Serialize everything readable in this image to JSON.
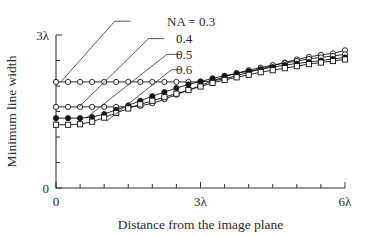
{
  "chart_data": {
    "type": "line",
    "title": "",
    "xlabel": "Distance from the image plane",
    "ylabel": "Minimum line width",
    "xlim": [
      0,
      6
    ],
    "ylim": [
      0,
      3
    ],
    "xtick_labels": [
      "0",
      "3λ",
      "6λ"
    ],
    "xtick_values": [
      0,
      3,
      6
    ],
    "ytick_labels": [
      "0",
      "3λ"
    ],
    "ytick_values": [
      0,
      3
    ],
    "x_minor_step": 0.5,
    "y_minor_step": 0.5,
    "grid": false,
    "legend_position": "upper-left-leader-lines",
    "legend_entries": [
      "NA = 0.3",
      "0.4",
      "0.5",
      "0.6"
    ],
    "series": [
      {
        "name": "NA = 0.3",
        "label": "NA = 0.3",
        "marker": "open-circle",
        "color": "#111111",
        "x": [
          0,
          0.25,
          0.5,
          0.75,
          1.0,
          1.25,
          1.5,
          1.75,
          2.0,
          2.25,
          2.5,
          2.75,
          3.0,
          3.25,
          3.5,
          3.75,
          4.0,
          4.25,
          4.5,
          4.75,
          5.0,
          5.25,
          5.5,
          5.75,
          6.0
        ],
        "y": [
          2.08,
          2.08,
          2.08,
          2.08,
          2.08,
          2.08,
          2.08,
          2.08,
          2.08,
          2.08,
          2.08,
          2.08,
          2.08,
          2.1,
          2.14,
          2.2,
          2.27,
          2.33,
          2.4,
          2.46,
          2.52,
          2.57,
          2.61,
          2.64,
          2.7
        ]
      },
      {
        "name": "NA = 0.4",
        "label": "0.4",
        "marker": "open-circle",
        "color": "#111111",
        "x": [
          0,
          0.25,
          0.5,
          0.75,
          1.0,
          1.25,
          1.5,
          1.75,
          2.0,
          2.25,
          2.5,
          2.75,
          3.0,
          3.25,
          3.5,
          3.75,
          4.0,
          4.25,
          4.5,
          4.75,
          5.0,
          5.25,
          5.5,
          5.75,
          6.0
        ],
        "y": [
          1.59,
          1.59,
          1.59,
          1.59,
          1.59,
          1.59,
          1.59,
          1.61,
          1.66,
          1.74,
          1.83,
          1.92,
          2.01,
          2.1,
          2.18,
          2.25,
          2.31,
          2.36,
          2.41,
          2.45,
          2.49,
          2.53,
          2.56,
          2.59,
          2.62
        ]
      },
      {
        "name": "NA = 0.5",
        "label": "0.5",
        "marker": "filled-circle",
        "color": "#111111",
        "x": [
          0,
          0.25,
          0.5,
          0.75,
          1.0,
          1.25,
          1.5,
          1.75,
          2.0,
          2.25,
          2.5,
          2.75,
          3.0,
          3.25,
          3.5,
          3.75,
          4.0,
          4.25,
          4.5,
          4.75,
          5.0,
          5.25,
          5.5,
          5.75,
          6.0
        ],
        "y": [
          1.37,
          1.37,
          1.37,
          1.39,
          1.45,
          1.53,
          1.62,
          1.71,
          1.8,
          1.88,
          1.96,
          2.03,
          2.09,
          2.15,
          2.2,
          2.25,
          2.29,
          2.33,
          2.37,
          2.41,
          2.44,
          2.47,
          2.5,
          2.53,
          2.56
        ]
      },
      {
        "name": "NA = 0.6",
        "label": "0.6",
        "marker": "square",
        "color": "#111111",
        "x": [
          0,
          0.25,
          0.5,
          0.75,
          1.0,
          1.25,
          1.5,
          1.75,
          2.0,
          2.25,
          2.5,
          2.75,
          3.0,
          3.25,
          3.5,
          3.75,
          4.0,
          4.25,
          4.5,
          4.75,
          5.0,
          5.25,
          5.5,
          5.75,
          6.0
        ],
        "y": [
          1.24,
          1.24,
          1.25,
          1.3,
          1.38,
          1.47,
          1.56,
          1.64,
          1.71,
          1.78,
          1.85,
          1.92,
          1.99,
          2.06,
          2.12,
          2.17,
          2.22,
          2.27,
          2.31,
          2.35,
          2.39,
          2.43,
          2.46,
          2.49,
          2.52
        ]
      }
    ],
    "leader_lines": [
      {
        "label": "NA = 0.3",
        "from_x": 1.55,
        "from_y": 3.27,
        "elbow_x": 1.22,
        "elbow_y": 3.27,
        "to_x": 0.1,
        "to_y": 2.08
      },
      {
        "label": "0.4",
        "from_x": 2.25,
        "from_y": 2.93,
        "elbow_x": 1.92,
        "elbow_y": 2.93,
        "to_x": 0.48,
        "to_y": 1.59
      },
      {
        "label": "0.5",
        "from_x": 2.6,
        "from_y": 2.62,
        "elbow_x": 2.3,
        "elbow_y": 2.62,
        "to_x": 0.62,
        "to_y": 1.37
      },
      {
        "label": "0.6",
        "from_x": 2.62,
        "from_y": 2.32,
        "elbow_x": 2.4,
        "elbow_y": 2.32,
        "to_x": 1.05,
        "to_y": 1.31
      }
    ]
  }
}
